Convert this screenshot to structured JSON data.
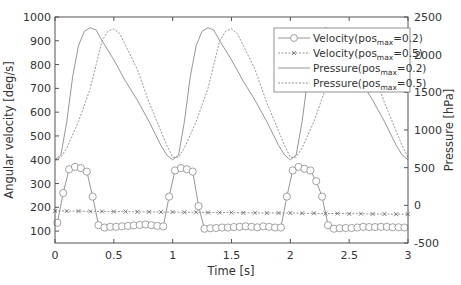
{
  "chart_data": {
    "type": "line",
    "title": "",
    "xlabel": "Time [s]",
    "ylabel": "Angular velocity [deg/s]",
    "y2label": "Pressure [hPa]",
    "xlim": [
      0,
      3
    ],
    "ylim": [
      50,
      1000
    ],
    "y2lim": [
      -500,
      2500
    ],
    "xticks": [
      "0",
      "0.5",
      "1",
      "1.5",
      "2",
      "2.5",
      "3"
    ],
    "yticks": [
      "100",
      "200",
      "300",
      "400",
      "500",
      "600",
      "700",
      "800",
      "900",
      "1000"
    ],
    "y2ticks": [
      "-500",
      "0",
      "500",
      "1000",
      "1500",
      "2000",
      "2500"
    ],
    "grid": false,
    "legend_position": "upper right",
    "series": [
      {
        "name": "Velocity(pos_max=0.2)",
        "axis": "left",
        "style": "solid-circle",
        "x": [
          0.02,
          0.07,
          0.12,
          0.17,
          0.22,
          0.27,
          0.32,
          0.37,
          0.42,
          0.47,
          0.52,
          0.57,
          0.62,
          0.67,
          0.72,
          0.77,
          0.82,
          0.87,
          0.92,
          0.97,
          1.02,
          1.07,
          1.12,
          1.17,
          1.22,
          1.27,
          1.32,
          1.37,
          1.42,
          1.47,
          1.52,
          1.57,
          1.62,
          1.67,
          1.72,
          1.77,
          1.82,
          1.87,
          1.92,
          1.97,
          2.02,
          2.07,
          2.12,
          2.17,
          2.22,
          2.27,
          2.32,
          2.37,
          2.42,
          2.47,
          2.52,
          2.57,
          2.62,
          2.67,
          2.72,
          2.77,
          2.82,
          2.87,
          2.92,
          2.97
        ],
        "values": [
          135,
          260,
          360,
          370,
          365,
          350,
          245,
          125,
          115,
          118,
          118,
          120,
          122,
          124,
          126,
          128,
          125,
          122,
          120,
          245,
          355,
          365,
          360,
          350,
          205,
          110,
          112,
          113,
          115,
          115,
          117,
          118,
          120,
          118,
          116,
          120,
          118,
          115,
          115,
          245,
          355,
          370,
          362,
          355,
          310,
          245,
          125,
          110,
          112,
          113,
          113,
          115,
          118,
          117,
          117,
          118,
          118,
          116,
          116,
          115
        ]
      },
      {
        "name": "Velocity(pos_max=0.5)",
        "axis": "left",
        "style": "dotted-x",
        "x": [
          0.0,
          0.1,
          0.2,
          0.3,
          0.4,
          0.5,
          0.6,
          0.7,
          0.8,
          0.9,
          1.0,
          1.1,
          1.2,
          1.3,
          1.4,
          1.5,
          1.6,
          1.7,
          1.8,
          1.9,
          2.0,
          2.1,
          2.2,
          2.3,
          2.4,
          2.5,
          2.6,
          2.7,
          2.8,
          2.9,
          3.0
        ],
        "values": [
          185,
          184,
          184,
          183,
          183,
          182,
          182,
          181,
          181,
          180,
          180,
          179,
          179,
          178,
          178,
          178,
          177,
          177,
          176,
          176,
          176,
          175,
          175,
          174,
          174,
          173,
          173,
          172,
          172,
          171,
          171
        ]
      },
      {
        "name": "Pressure(pos_max=0.2)",
        "axis": "right",
        "style": "solid",
        "x": [
          0.0,
          0.05,
          0.1,
          0.15,
          0.2,
          0.25,
          0.3,
          0.35,
          0.4,
          0.5,
          0.6,
          0.7,
          0.8,
          0.9,
          0.95,
          1.0,
          1.05,
          1.1,
          1.15,
          1.2,
          1.25,
          1.3,
          1.35,
          1.4,
          1.5,
          1.6,
          1.7,
          1.8,
          1.9,
          1.95,
          2.0,
          2.05,
          2.1,
          2.15,
          2.2,
          2.25,
          2.3,
          2.35,
          2.4,
          2.5,
          2.6,
          2.7,
          2.8,
          2.9,
          2.95,
          3.0
        ],
        "values": [
          605,
          668,
          1111,
          1711,
          2121,
          2311,
          2358,
          2326,
          2184,
          1932,
          1647,
          1395,
          1111,
          795,
          668,
          605,
          668,
          1111,
          1711,
          2121,
          2311,
          2358,
          2326,
          2184,
          1932,
          1647,
          1395,
          1111,
          795,
          668,
          605,
          668,
          1111,
          1711,
          2121,
          2311,
          2358,
          2326,
          2184,
          1932,
          1647,
          1395,
          1111,
          795,
          668,
          605
        ]
      },
      {
        "name": "Pressure(pos_max=0.5)",
        "axis": "right",
        "style": "dotted",
        "x": [
          0.0,
          0.05,
          0.1,
          0.2,
          0.3,
          0.35,
          0.4,
          0.45,
          0.5,
          0.55,
          0.6,
          0.7,
          0.8,
          0.9,
          0.95,
          1.0,
          1.05,
          1.1,
          1.2,
          1.3,
          1.35,
          1.4,
          1.45,
          1.5,
          1.55,
          1.6,
          1.7,
          1.8,
          1.9,
          1.95,
          2.0,
          2.05,
          2.1,
          2.2,
          2.3,
          2.35,
          2.4,
          2.45,
          2.5,
          2.55,
          2.6,
          2.7,
          2.8,
          2.9,
          2.95,
          3.0
        ],
        "values": [
          605,
          637,
          763,
          1111,
          1553,
          1868,
          2184,
          2311,
          2342,
          2279,
          2121,
          1805,
          1363,
          984,
          795,
          637,
          637,
          763,
          1111,
          1553,
          1868,
          2184,
          2311,
          2342,
          2279,
          2121,
          1805,
          1363,
          984,
          795,
          637,
          637,
          763,
          1111,
          1553,
          1868,
          2184,
          2311,
          2342,
          2279,
          2121,
          1805,
          1363,
          984,
          795,
          637
        ]
      }
    ]
  },
  "legend": {
    "entries": [
      {
        "prefix": "Velocity(pos",
        "sub": "max",
        "suffix": "=0.2)"
      },
      {
        "prefix": "Velocity(pos",
        "sub": "max",
        "suffix": "=0.5)"
      },
      {
        "prefix": "Pressure(pos",
        "sub": "max",
        "suffix": "=0.2)"
      },
      {
        "prefix": "Pressure(pos",
        "sub": "max",
        "suffix": "=0.5)"
      }
    ]
  },
  "colors": {
    "line": "#8a8a8a",
    "axis": "#555555",
    "text": "#333333"
  }
}
